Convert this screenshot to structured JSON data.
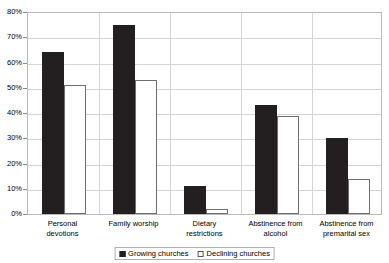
{
  "chart_data": {
    "type": "bar",
    "title": "",
    "subtitle": "",
    "xlabel": "",
    "ylabel": "",
    "ylim": [
      0,
      80
    ],
    "ytick_values": [
      0,
      10,
      20,
      30,
      40,
      50,
      60,
      70,
      80
    ],
    "ytick_labels": [
      "0%",
      "10%",
      "20%",
      "30%",
      "40%",
      "50%",
      "60%",
      "70%",
      "80%"
    ],
    "grid": true,
    "legend_position": "bottom-center",
    "categories": [
      "Personal\ndevotions",
      "Family worship",
      "Dietary\nrestrictions",
      "Abstinence from\nalcohol",
      "Abstinence from\npremarital sex"
    ],
    "series": [
      {
        "name": "Growing churches",
        "color": "#231f20",
        "values": [
          64,
          75,
          11,
          43,
          30
        ]
      },
      {
        "name": "Declining churches",
        "color": "#ffffff",
        "values": [
          51,
          53,
          2,
          39,
          14
        ]
      }
    ]
  },
  "colors": {
    "growing": "#231f20",
    "declining": "#ffffff",
    "declining_border": "#6e6e6e",
    "gridline": "#d4d4d4",
    "frame": "#b9b9b9",
    "background": "#ffffff",
    "text": "#000000"
  }
}
